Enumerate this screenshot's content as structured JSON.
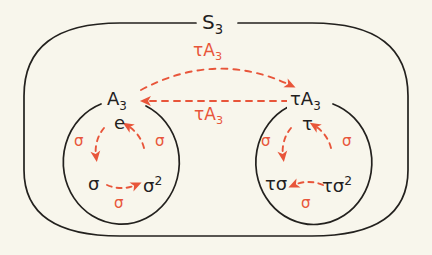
{
  "figure": {
    "background_color": "#f8f6ec",
    "ink_color": "#23211e",
    "accent_color": "#e8553a"
  },
  "outer_set": {
    "label": "S",
    "label_subscript": "3",
    "shape": "rounded-rectangle"
  },
  "left_coset": {
    "label": "A",
    "label_subscript": "3",
    "shape": "circle",
    "elements": [
      {
        "id": "identity",
        "text": "e",
        "position": "top"
      },
      {
        "id": "sigma",
        "text": "σ",
        "position": "bottom-left"
      },
      {
        "id": "sigma-squared",
        "text": "σ",
        "superscript": "2",
        "position": "bottom-right"
      }
    ],
    "cycle_arrow_labels": [
      {
        "id": "left",
        "text": "σ"
      },
      {
        "id": "bottom",
        "text": "σ"
      },
      {
        "id": "right",
        "text": "σ"
      }
    ],
    "cycle_direction": "counterclockwise"
  },
  "right_coset": {
    "label_prefix": "τ",
    "label": "A",
    "label_subscript": "3",
    "shape": "circle",
    "elements": [
      {
        "id": "tau",
        "text": "τ",
        "position": "top"
      },
      {
        "id": "tau-sigma",
        "text": "τσ",
        "position": "bottom-left"
      },
      {
        "id": "tau-sigma-squared",
        "text": "τσ",
        "superscript": "2",
        "position": "bottom-right"
      }
    ],
    "cycle_arrow_labels": [
      {
        "id": "left",
        "text": "σ"
      },
      {
        "id": "bottom",
        "text": "σ"
      },
      {
        "id": "right",
        "text": "σ"
      }
    ],
    "cycle_direction": "counterclockwise"
  },
  "coset_maps": [
    {
      "id": "upper-arc",
      "label_prefix": "τ",
      "label": "A",
      "label_subscript": "3",
      "direction": "left-to-right",
      "style": "dashed-arc"
    },
    {
      "id": "lower-straight",
      "label_prefix": "τ",
      "label": "A",
      "label_subscript": "3",
      "direction": "right-to-left",
      "style": "dashed-straight"
    }
  ]
}
